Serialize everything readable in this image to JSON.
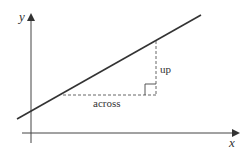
{
  "diagram": {
    "axes": {
      "x_label": "x",
      "y_label": "y"
    },
    "annotations": {
      "up_label": "up",
      "across_label": "across"
    },
    "colors": {
      "line": "#333333",
      "axis": "#444444",
      "dashed": "#555555"
    }
  }
}
